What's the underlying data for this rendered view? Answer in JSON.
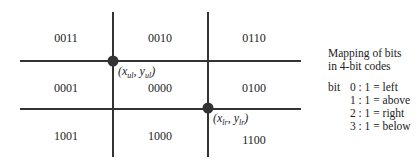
{
  "diagram": {
    "region_codes": [
      {
        "code": "0011",
        "x": 66,
        "y": 38
      },
      {
        "code": "0010",
        "x": 160,
        "y": 38
      },
      {
        "code": "0110",
        "x": 254,
        "y": 38
      },
      {
        "code": "0001",
        "x": 66,
        "y": 88
      },
      {
        "code": "0000",
        "x": 160,
        "y": 88
      },
      {
        "code": "0100",
        "x": 254,
        "y": 88
      },
      {
        "code": "1001",
        "x": 66,
        "y": 136
      },
      {
        "code": "1000",
        "x": 160,
        "y": 136
      },
      {
        "code": "1100",
        "x": 254,
        "y": 136
      }
    ],
    "points": {
      "upper_left": {
        "label_var_x": "x",
        "label_sub_x": "ul",
        "label_var_y": "y",
        "label_sub_y": "ul"
      },
      "lower_right": {
        "label_var_x": "x",
        "label_sub_x": "lr",
        "label_var_y": "y",
        "label_sub_y": "lr"
      }
    },
    "line_color": "#333333"
  },
  "legend": {
    "title_line1": "Mapping of bits",
    "title_line2": "in 4-bit codes",
    "bit_prefix": "bit",
    "rows": [
      {
        "bit": "0",
        "text": "0 : 1 = left"
      },
      {
        "bit": "1",
        "text": "1 : 1 = above"
      },
      {
        "bit": "2",
        "text": "2 : 1 = right"
      },
      {
        "bit": "3",
        "text": "3 : 1 = below"
      }
    ]
  }
}
